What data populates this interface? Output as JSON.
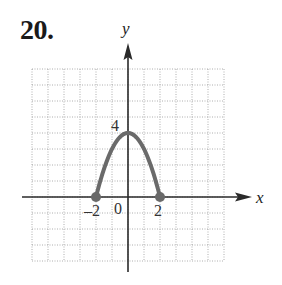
{
  "problem": {
    "number": "20."
  },
  "chart_data": {
    "type": "line",
    "title": "",
    "xlabel": "x",
    "ylabel": "y",
    "x_tick_labels": [
      {
        "value": -2,
        "label": "–2"
      },
      {
        "value": 0,
        "label": "0"
      },
      {
        "value": 2,
        "label": "2"
      }
    ],
    "y_tick_labels": [
      {
        "value": 4,
        "label": "4"
      }
    ],
    "xlim": [
      -6,
      6
    ],
    "ylim": [
      -4,
      8
    ],
    "grid": true,
    "grid_style": "dotted",
    "grid_step": 1,
    "series": [
      {
        "name": "curve",
        "color": "#666666",
        "x": [
          -2,
          0,
          2
        ],
        "y": [
          0,
          4,
          0
        ],
        "observed_points": [
          [
            -2,
            0
          ],
          [
            0,
            4
          ],
          [
            2,
            0
          ]
        ],
        "equation_inferred": "y = 4 - x^2",
        "equation_note": "Inferred from three labeled landmarks (endpoints and vertex); intermediate curve points not verified",
        "endpoints": [
          {
            "x": -2,
            "y": 0,
            "style": "closed-dot"
          },
          {
            "x": 2,
            "y": 0,
            "style": "closed-dot"
          }
        ]
      }
    ]
  },
  "style": {
    "axis_color": "#2a2a2a",
    "grid_color": "#9a9a9a",
    "curve_color": "#6a6a6a"
  }
}
